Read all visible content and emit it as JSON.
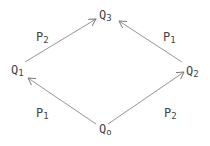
{
  "diagram": {
    "type": "commutative-diamond",
    "nodes": [
      {
        "id": "Q0",
        "base": "Q",
        "sub": "o"
      },
      {
        "id": "Q1",
        "base": "Q",
        "sub": "1"
      },
      {
        "id": "Q2",
        "base": "Q",
        "sub": "2"
      },
      {
        "id": "Q3",
        "base": "Q",
        "sub": "3"
      }
    ],
    "edges": [
      {
        "from": "Q0",
        "to": "Q1",
        "label": {
          "base": "P",
          "sub": "1"
        }
      },
      {
        "from": "Q0",
        "to": "Q2",
        "label": {
          "base": "P",
          "sub": "2"
        }
      },
      {
        "from": "Q1",
        "to": "Q3",
        "label": {
          "base": "P",
          "sub": "2"
        }
      },
      {
        "from": "Q2",
        "to": "Q3",
        "label": {
          "base": "P",
          "sub": "1"
        }
      }
    ],
    "colors": {
      "line": "#777777",
      "text": "#444444"
    }
  }
}
